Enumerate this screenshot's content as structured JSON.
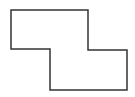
{
  "diagram": {
    "shape": "polygon",
    "stroke_color": "#333333",
    "fill_color": "#ffffff",
    "stroke_width": 1.5,
    "points": "11,10 88,10 88,50 127,50 127,90 50,90 50,49 11,49"
  }
}
